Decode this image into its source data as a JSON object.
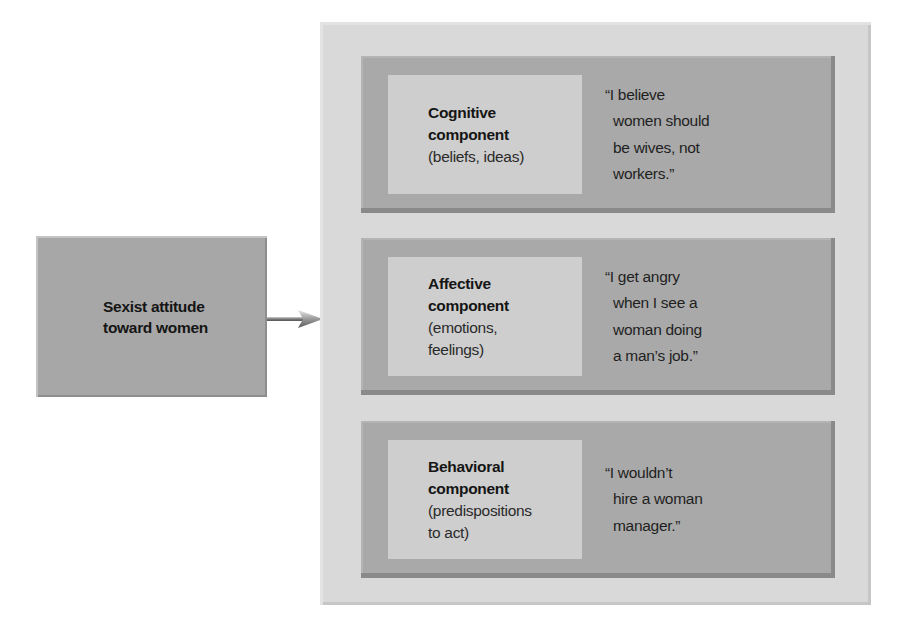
{
  "source": {
    "label_lines": [
      "Sexist attitude",
      "toward women"
    ]
  },
  "arrow": {
    "icon": "arrow-right-icon"
  },
  "components": [
    {
      "title_lines": [
        "Cognitive",
        "component"
      ],
      "desc_lines": [
        "(beliefs, ideas)"
      ],
      "quote_lines": [
        "“I believe",
        "women should",
        "be wives, not",
        "workers.”"
      ]
    },
    {
      "title_lines": [
        "Affective",
        "component"
      ],
      "desc_lines": [
        "(emotions,",
        "feelings)"
      ],
      "quote_lines": [
        "“I get angry",
        "when I see a",
        "woman doing",
        "a man’s job.”"
      ]
    },
    {
      "title_lines": [
        "Behavioral",
        "component"
      ],
      "desc_lines": [
        "(predispositions",
        "to act)"
      ],
      "quote_lines": [
        "“I wouldn’t",
        "hire a woman",
        "manager.”"
      ]
    }
  ],
  "colors": {
    "background": "#ffffff",
    "outer_panel": "#d9d9d9",
    "card": "#a9a9a9",
    "inner_box": "#cecece",
    "source_box": "#a7a7a7"
  }
}
